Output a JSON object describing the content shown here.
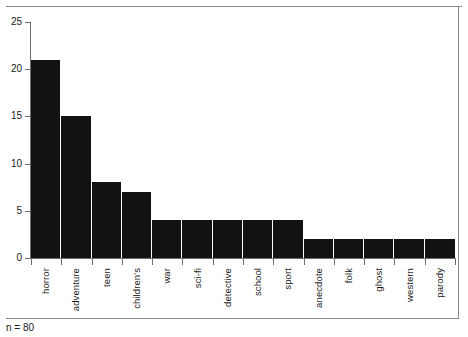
{
  "chart_data": {
    "type": "bar",
    "title": "",
    "subtitle": "",
    "xlabel": "",
    "ylabel": "",
    "categories": [
      "horror",
      "adventure",
      "teen",
      "children's",
      "war",
      "sci-fi",
      "detective",
      "school",
      "sport",
      "anecdote",
      "folk",
      "ghost",
      "western",
      "parody"
    ],
    "values": [
      21,
      15,
      8,
      7,
      4,
      4,
      4,
      4,
      4,
      2,
      2,
      2,
      2,
      2
    ],
    "ylim": [
      0,
      25
    ],
    "yticks": [
      0,
      5,
      10,
      15,
      20,
      25
    ],
    "ytick_labels": [
      "0",
      "5",
      "10",
      "15",
      "20",
      "25"
    ],
    "grid": false,
    "legend": null,
    "bar_color": "#121212",
    "axis_color": "#6e6e6e",
    "frame_color": "#8a8a8a"
  },
  "footnote": {
    "text": "n = 80"
  }
}
